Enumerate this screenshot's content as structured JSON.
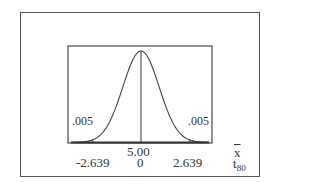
{
  "chart_data": {
    "type": "area",
    "title": "",
    "distribution": "t",
    "df": 80,
    "center": 5.0,
    "critical_values": [
      -2.639,
      2.639
    ],
    "tail_areas": [
      0.005,
      0.005
    ],
    "axes": [
      {
        "name": "x-bar",
        "ticks": [
          {
            "pos": 0,
            "label": "5.00"
          }
        ]
      },
      {
        "name": "t_80",
        "ticks": [
          {
            "pos": -2.639,
            "label": "-2.639"
          },
          {
            "pos": 0,
            "label": "0"
          },
          {
            "pos": 2.639,
            "label": "2.639"
          }
        ]
      }
    ],
    "grid": false,
    "legend": null
  },
  "labels": {
    "left_tail": ".005",
    "right_tail": ".005",
    "mean_value": "5.00",
    "t_left": "-2.639",
    "t_center": "0",
    "t_right": "2.639",
    "xbar_axis": "x",
    "t_axis_main": "t",
    "t_axis_sub": "80"
  }
}
